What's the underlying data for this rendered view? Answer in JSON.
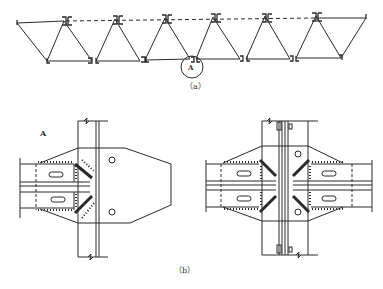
{
  "figure": {
    "part_a": {
      "caption": "（a）",
      "detail_marker": "A",
      "description": "truss elevation with purlin-style connectors at top and bottom chord nodes; dashed top chord line"
    },
    "part_b": {
      "caption": "（b）",
      "detail_label": "A",
      "views": [
        {
          "name": "end-connection",
          "description": "single-sided gusset plate joint at column with slotted holes and fillet welds"
        },
        {
          "name": "middle-connection",
          "description": "double-sided gusset plate joint at column with bolted splice"
        }
      ]
    },
    "colors": {
      "line": "#2a2a2a",
      "background": "#ffffff"
    }
  }
}
